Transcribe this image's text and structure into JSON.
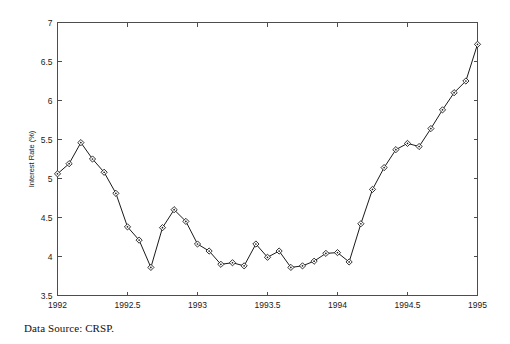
{
  "figure": {
    "caption": "Data Source:  CRSP."
  },
  "chart_data": {
    "type": "line",
    "title": "",
    "subtitle": "",
    "xlabel": "",
    "ylabel": "Interest Rate (%)",
    "xlim": [
      1992,
      1995
    ],
    "ylim": [
      3.5,
      7
    ],
    "grid": false,
    "legend": null,
    "marker": "diamond",
    "line_color": "#1a1a1a",
    "marker_face_color": "#ffffff",
    "xticks": [
      1992,
      1992.5,
      1993,
      1993.5,
      1994,
      1994.5,
      1995
    ],
    "xticklabels": [
      "1992",
      "1992.5",
      "1993",
      "1993.5",
      "1994",
      "1994.5",
      "1995"
    ],
    "yticks": [
      3.5,
      4,
      4.5,
      5,
      5.5,
      6,
      6.5,
      7
    ],
    "yticklabels": [
      "3.5",
      "4",
      "4.5",
      "5",
      "5.5",
      "6",
      "6.5",
      "7"
    ],
    "series": [
      {
        "name": "Interest Rate",
        "x": [
          1992.0,
          1992.083,
          1992.167,
          1992.25,
          1992.333,
          1992.417,
          1992.5,
          1992.583,
          1992.667,
          1992.75,
          1992.833,
          1992.917,
          1993.0,
          1993.083,
          1993.167,
          1993.25,
          1993.333,
          1993.417,
          1993.5,
          1993.583,
          1993.667,
          1993.75,
          1993.833,
          1993.917,
          1994.0,
          1994.083,
          1994.167,
          1994.25,
          1994.333,
          1994.417,
          1994.5,
          1994.583,
          1994.667,
          1994.75,
          1994.833,
          1994.917,
          1995.0
        ],
        "values": [
          5.06,
          5.19,
          5.46,
          5.25,
          5.08,
          4.81,
          4.38,
          4.21,
          3.86,
          4.37,
          4.6,
          4.45,
          4.16,
          4.07,
          3.9,
          3.92,
          3.88,
          4.16,
          3.99,
          4.07,
          3.86,
          3.88,
          3.94,
          4.04,
          4.05,
          3.93,
          4.42,
          4.86,
          5.14,
          5.37,
          5.45,
          5.41,
          5.64,
          5.88,
          6.1,
          6.25,
          6.72
        ]
      }
    ],
    "annotations": []
  }
}
